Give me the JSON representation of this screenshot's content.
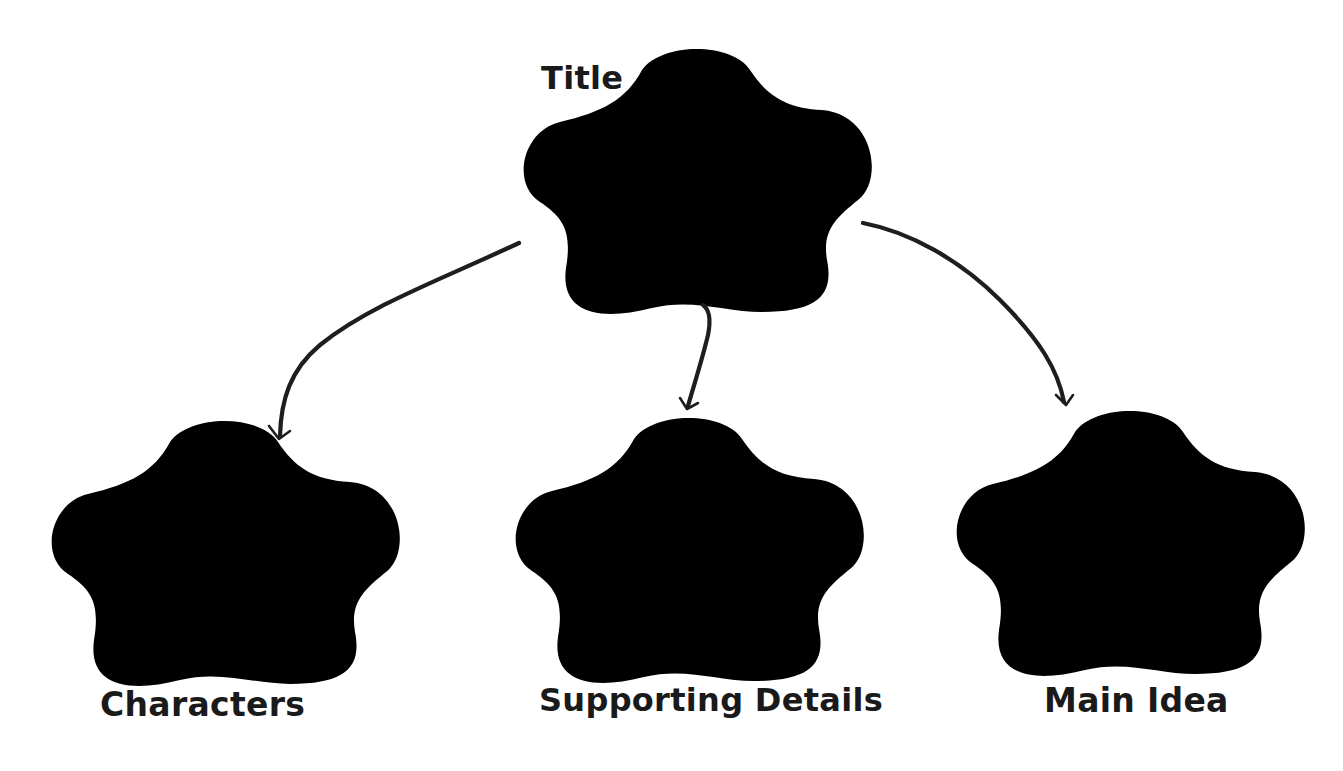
{
  "diagram": {
    "type": "graphic-organizer",
    "root": {
      "id": "title",
      "label": "Title"
    },
    "children": [
      {
        "id": "characters",
        "label": "Characters"
      },
      {
        "id": "supporting-details",
        "label": "Supporting Details"
      },
      {
        "id": "main-idea",
        "label": "Main Idea"
      }
    ],
    "edges": [
      {
        "from": "title",
        "to": "characters"
      },
      {
        "from": "title",
        "to": "supporting-details"
      },
      {
        "from": "title",
        "to": "main-idea"
      }
    ],
    "colors": {
      "background": "#ffffff",
      "cloud_stroke": "#8a8a8a",
      "arrow": "#1e1e1e",
      "text": "#1a1a1a"
    }
  }
}
